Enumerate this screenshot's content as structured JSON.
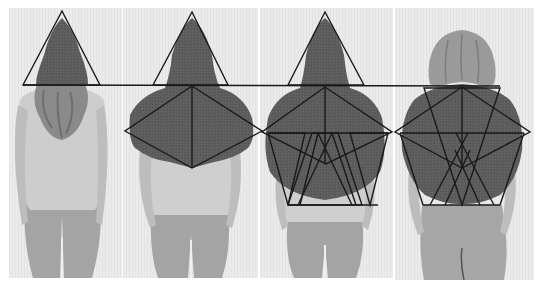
{
  "image": {
    "description": "Four photographs of the same person from behind, side by side, with geometric triangle and diamond line overlays drawn over the head and torso",
    "width": 542,
    "height": 288,
    "background_color": "#ffffff",
    "photo_background_color": "#ececec",
    "overlay_line_color": "#1a1a1a",
    "garment_color": "#5c5c5c",
    "skin_clothing_color": "#b4b4b4",
    "pants_color": "#a2a2a2"
  },
  "panels": [
    {
      "index": 1,
      "label": "figure-1",
      "hood": true,
      "overlays": [
        "head-triangle"
      ]
    },
    {
      "index": 2,
      "label": "figure-2",
      "hood": true,
      "overlays": [
        "head-triangle",
        "shoulder-diamond",
        "vertical-axis"
      ]
    },
    {
      "index": 3,
      "label": "figure-3",
      "hood": true,
      "overlays": [
        "head-triangle",
        "shoulder-diamond",
        "vertical-axis",
        "interlocking-triangles"
      ]
    },
    {
      "index": 4,
      "label": "figure-4",
      "hood": false,
      "overlays": [
        "inverted-triangle",
        "shoulder-diamond",
        "vertical-axis",
        "interlocking-triangles"
      ]
    }
  ],
  "text": []
}
